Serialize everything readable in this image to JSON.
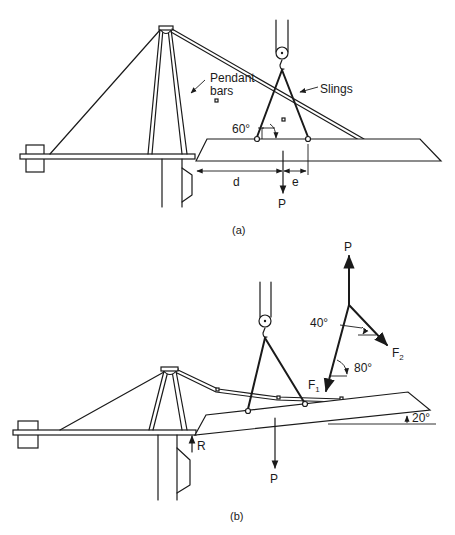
{
  "figure": {
    "panels": [
      {
        "id": "a",
        "caption": "(a)",
        "labels": {
          "pendant_line1": "Pendant",
          "pendant_line2": "bars",
          "slings": "Slings",
          "angle": "60°",
          "dim_d": "d",
          "dim_e": "e",
          "load": "P"
        }
      },
      {
        "id": "b",
        "caption": "(b)",
        "labels": {
          "reaction": "R",
          "load": "P",
          "tilt_angle": "20°",
          "fbd_load": "P",
          "fbd_angle_upper": "40°",
          "fbd_angle_lower": "80°",
          "force1": "F",
          "force1_sub": "1",
          "force2": "F",
          "force2_sub": "2"
        }
      }
    ]
  }
}
